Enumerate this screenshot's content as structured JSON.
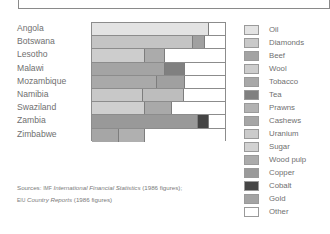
{
  "chart_data": {
    "type": "bar",
    "orientation": "horizontal",
    "stacked": true,
    "normalized_percent": true,
    "title": "",
    "xlabel": "",
    "ylabel": "",
    "xlim": [
      0,
      100
    ],
    "grid": false,
    "legend_position": "right",
    "categories": [
      "Angola",
      "Botswana",
      "Lesotho",
      "Malawi",
      "Mozambique",
      "Namibia",
      "Swaziland",
      "Zambia",
      "Zimbabwe"
    ],
    "legend": [
      {
        "name": "Oil",
        "color": "#e3e3e3"
      },
      {
        "name": "Diamonds",
        "color": "#c9c9c9"
      },
      {
        "name": "Beef",
        "color": "#a3a3a3"
      },
      {
        "name": "Wool",
        "color": "#cdcdcd"
      },
      {
        "name": "Tobacco",
        "color": "#a8a8a8"
      },
      {
        "name": "Tea",
        "color": "#808080"
      },
      {
        "name": "Prawns",
        "color": "#b2b2b2"
      },
      {
        "name": "Cashews",
        "color": "#a6a6a6"
      },
      {
        "name": "Uranium",
        "color": "#cbcbcb"
      },
      {
        "name": "Sugar",
        "color": "#d2d2d2"
      },
      {
        "name": "Wood pulp",
        "color": "#ababab"
      },
      {
        "name": "Copper",
        "color": "#9a9a9a"
      },
      {
        "name": "Cobalt",
        "color": "#454545"
      },
      {
        "name": "Gold",
        "color": "#a4a4a4"
      },
      {
        "name": "Other",
        "color": "#ffffff"
      }
    ],
    "rows": [
      {
        "country": "Angola",
        "segments": [
          {
            "name": "Oil",
            "value": 88,
            "color": "#e3e3e3"
          },
          {
            "name": "Other",
            "value": 12,
            "color": "#ffffff"
          }
        ]
      },
      {
        "country": "Botswana",
        "segments": [
          {
            "name": "Diamonds",
            "value": 76,
            "color": "#c4c4c4"
          },
          {
            "name": "Beef",
            "value": 9,
            "color": "#a0a0a0"
          },
          {
            "name": "Other",
            "value": 15,
            "color": "#ffffff"
          }
        ]
      },
      {
        "country": "Lesotho",
        "segments": [
          {
            "name": "Wool",
            "value": 40,
            "color": "#cdcdcd"
          },
          {
            "name": "Beef",
            "value": 15,
            "color": "#ababab"
          },
          {
            "name": "Other",
            "value": 45,
            "color": "#ffffff"
          }
        ]
      },
      {
        "country": "Malawi",
        "segments": [
          {
            "name": "Tobacco",
            "value": 55,
            "color": "#a4a4a4"
          },
          {
            "name": "Tea",
            "value": 15,
            "color": "#808080"
          },
          {
            "name": "Other",
            "value": 30,
            "color": "#ffffff"
          }
        ]
      },
      {
        "country": "Mozambique",
        "segments": [
          {
            "name": "Prawns",
            "value": 49,
            "color": "#a9a9a9"
          },
          {
            "name": "Cashews",
            "value": 21,
            "color": "#a0a0a0"
          },
          {
            "name": "Other",
            "value": 30,
            "color": "#ffffff"
          }
        ]
      },
      {
        "country": "Namibia",
        "segments": [
          {
            "name": "Diamonds",
            "value": 38,
            "color": "#c8c8c8"
          },
          {
            "name": "Uranium",
            "value": 31,
            "color": "#bdbdbd"
          },
          {
            "name": "Other",
            "value": 31,
            "color": "#ffffff"
          }
        ]
      },
      {
        "country": "Swaziland",
        "segments": [
          {
            "name": "Sugar",
            "value": 40,
            "color": "#cfcfcf"
          },
          {
            "name": "Wood pulp",
            "value": 20,
            "color": "#a9a9a9"
          },
          {
            "name": "Other",
            "value": 40,
            "color": "#ffffff"
          }
        ]
      },
      {
        "country": "Zambia",
        "segments": [
          {
            "name": "Copper",
            "value": 80,
            "color": "#999999"
          },
          {
            "name": "Cobalt",
            "value": 8,
            "color": "#444444"
          },
          {
            "name": "Other",
            "value": 12,
            "color": "#ffffff"
          }
        ]
      },
      {
        "country": "Zimbabwe",
        "segments": [
          {
            "name": "Gold",
            "value": 20,
            "color": "#a6a6a6"
          },
          {
            "name": "Tobacco",
            "value": 20,
            "color": "#b0b0b0"
          },
          {
            "name": "Other",
            "value": 60,
            "color": "#ffffff"
          }
        ]
      }
    ]
  },
  "sources": {
    "prefix": "Sources: ",
    "line1_org": "IMF",
    "line1_title": "International Financial Statistics",
    "line1_suffix": " (1986 figures);",
    "line2_org": "EIU",
    "line2_title": "Country Reports",
    "line2_suffix": " (1986 figures)"
  }
}
